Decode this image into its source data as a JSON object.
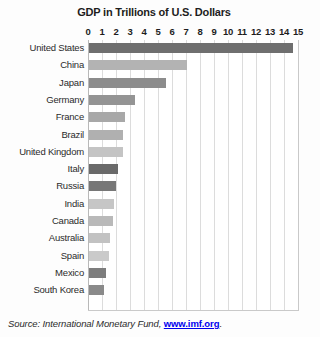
{
  "chart_data": {
    "type": "bar",
    "orientation": "horizontal",
    "title": "GDP in Trillions of U.S. Dollars",
    "xlabel": "",
    "ylabel": "",
    "xlim": [
      0,
      15
    ],
    "xticks": [
      0,
      1,
      2,
      3,
      4,
      5,
      6,
      7,
      8,
      9,
      10,
      11,
      12,
      13,
      14,
      15
    ],
    "xtick_labels": [
      "0",
      "1",
      "2",
      "3",
      "4",
      "5",
      "6",
      "7",
      "8",
      "9",
      "10",
      "11",
      "12",
      "13",
      "14",
      "15"
    ],
    "grid": true,
    "legend": false,
    "categories": [
      "United States",
      "China",
      "Japan",
      "Germany",
      "France",
      "Brazil",
      "United Kingdom",
      "Italy",
      "Russia",
      "India",
      "Canada",
      "Australia",
      "Spain",
      "Mexico",
      "South Korea"
    ],
    "values": [
      14.6,
      7.0,
      5.5,
      3.3,
      2.6,
      2.4,
      2.4,
      2.1,
      1.9,
      1.8,
      1.7,
      1.5,
      1.4,
      1.2,
      1.1
    ],
    "bar_colors": [
      "#6f6f6f",
      "#b3b3b3",
      "#8c8c8c",
      "#949494",
      "#a8a8a8",
      "#b0b0b0",
      "#c4c4c4",
      "#6a6a6a",
      "#777777",
      "#c6c6c6",
      "#b9b9b9",
      "#c2c2c2",
      "#cacaca",
      "#7d7d7d",
      "#8a8a8a"
    ]
  },
  "source": {
    "prefix": "Source: International Monetary Fund, ",
    "url": "www.imf.org",
    "period": "."
  }
}
